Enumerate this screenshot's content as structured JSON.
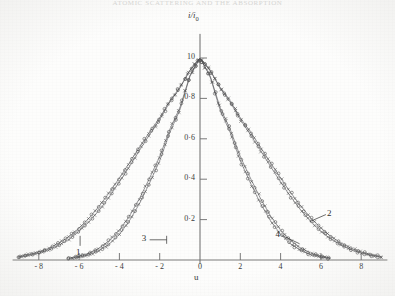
{
  "title": "ATOMIC SCATTERING AND THE ABSORPTION",
  "axes": {
    "y_label": "i/i",
    "y_label_sub": "0",
    "x_label": "u"
  },
  "chart_data": {
    "type": "scatter",
    "title": "ATOMIC SCATTERING AND THE ABSORPTION",
    "xlabel": "u",
    "ylabel": "i/i0",
    "xlim": [
      -9.3,
      9.3
    ],
    "ylim": [
      0,
      1.06
    ],
    "grid": false,
    "legend_position": "inline-annotations",
    "x_ticks": [
      -8,
      -6,
      -4,
      -2,
      0,
      2,
      4,
      6,
      8
    ],
    "x_tick_labels": [
      "- 8",
      "- 6",
      "- 4",
      "- 2",
      "0",
      "2",
      "4",
      "6",
      "8"
    ],
    "y_ticks": [
      0.2,
      0.4,
      0.6,
      0.8,
      1.0
    ],
    "y_tick_labels": [
      "0·2",
      "0·4",
      "0·6",
      "0·8",
      "10"
    ],
    "marker": "open-circle-and-cross",
    "annotations": [
      {
        "label": "1",
        "x": -6.0,
        "y": 0.085,
        "leader": "up"
      },
      {
        "label": "2",
        "x": 6.05,
        "y": 0.225,
        "leader": "left-down"
      },
      {
        "label": "3",
        "x": -2.35,
        "y": 0.1,
        "leader": "right"
      },
      {
        "label": "4",
        "x": 3.95,
        "y": 0.12,
        "leader": "right-down"
      }
    ],
    "series": [
      {
        "name": "1",
        "description": "broad distribution, left annotation",
        "width_sigma": 3.15,
        "x": [
          -9.0,
          -8.5,
          -8.0,
          -7.5,
          -7.0,
          -6.5,
          -6.0,
          -5.5,
          -5.0,
          -4.5,
          -4.0,
          -3.5,
          -3.0,
          -2.5,
          -2.0,
          -1.5,
          -1.0,
          -0.5,
          0.0,
          0.5,
          1.0,
          1.5,
          2.0,
          2.5,
          3.0,
          3.5,
          4.0,
          4.5,
          5.0,
          5.5,
          6.0,
          6.5,
          7.0,
          7.5,
          8.0,
          8.5,
          9.0
        ],
        "values": [
          0.017,
          0.027,
          0.04,
          0.058,
          0.084,
          0.116,
          0.158,
          0.208,
          0.267,
          0.334,
          0.406,
          0.482,
          0.559,
          0.634,
          0.704,
          0.788,
          0.854,
          0.94,
          1.0,
          0.94,
          0.854,
          0.788,
          0.704,
          0.634,
          0.559,
          0.482,
          0.406,
          0.334,
          0.267,
          0.208,
          0.158,
          0.116,
          0.084,
          0.058,
          0.04,
          0.027,
          0.017
        ]
      },
      {
        "name": "2",
        "description": "broad distribution, right annotation",
        "width_sigma": 3.05,
        "x": [
          -9.0,
          -8.5,
          -8.0,
          -7.5,
          -7.0,
          -6.5,
          -6.0,
          -5.5,
          -5.0,
          -4.5,
          -4.0,
          -3.5,
          -3.0,
          -2.5,
          -2.0,
          -1.5,
          -1.0,
          -0.5,
          0.0,
          0.5,
          1.0,
          1.5,
          2.0,
          2.5,
          3.0,
          3.5,
          4.0,
          4.5,
          5.0,
          5.5,
          6.0,
          6.5,
          7.0,
          7.5,
          8.0,
          8.5,
          9.0
        ],
        "values": [
          0.013,
          0.022,
          0.034,
          0.05,
          0.073,
          0.103,
          0.142,
          0.19,
          0.247,
          0.313,
          0.386,
          0.463,
          0.543,
          0.621,
          0.695,
          0.781,
          0.851,
          0.938,
          1.0,
          0.938,
          0.851,
          0.781,
          0.695,
          0.621,
          0.543,
          0.463,
          0.386,
          0.313,
          0.247,
          0.19,
          0.142,
          0.103,
          0.073,
          0.05,
          0.034,
          0.022,
          0.013
        ]
      },
      {
        "name": "3",
        "description": "narrow distribution, left annotation",
        "width_sigma": 2.12,
        "x": [
          -6.5,
          -6.0,
          -5.5,
          -5.0,
          -4.5,
          -4.0,
          -3.5,
          -3.0,
          -2.5,
          -2.0,
          -1.5,
          -1.0,
          -0.5,
          0.0,
          0.5,
          1.0,
          1.5,
          2.0,
          2.5,
          3.0,
          3.5,
          4.0,
          4.5,
          5.0,
          5.5,
          6.0,
          6.5
        ],
        "values": [
          0.01,
          0.019,
          0.034,
          0.059,
          0.096,
          0.148,
          0.218,
          0.305,
          0.406,
          0.512,
          0.647,
          0.754,
          0.913,
          1.0,
          0.913,
          0.754,
          0.647,
          0.512,
          0.406,
          0.305,
          0.218,
          0.148,
          0.096,
          0.059,
          0.034,
          0.019,
          0.01
        ]
      },
      {
        "name": "4",
        "description": "narrow distribution, right annotation",
        "width_sigma": 2.02,
        "x": [
          -6.5,
          -6.0,
          -5.5,
          -5.0,
          -4.5,
          -4.0,
          -3.5,
          -3.0,
          -2.5,
          -2.0,
          -1.5,
          -1.0,
          -0.5,
          0.0,
          0.5,
          1.0,
          1.5,
          2.0,
          2.5,
          3.0,
          3.5,
          4.0,
          4.5,
          5.0,
          5.5,
          6.0,
          6.5
        ],
        "values": [
          0.007,
          0.014,
          0.026,
          0.047,
          0.079,
          0.127,
          0.194,
          0.28,
          0.382,
          0.491,
          0.631,
          0.742,
          0.909,
          1.0,
          0.909,
          0.742,
          0.631,
          0.491,
          0.382,
          0.28,
          0.194,
          0.127,
          0.079,
          0.047,
          0.026,
          0.014,
          0.007
        ]
      }
    ]
  },
  "colors": {
    "ink": "#2e2e2e",
    "axis": "#6b6b6b",
    "marker": "#4a4a4a",
    "background": "#fdfdfc",
    "title_faded": "#d8d8d6"
  }
}
